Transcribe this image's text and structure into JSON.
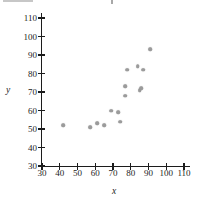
{
  "chart_data": {
    "type": "scatter",
    "title": "",
    "xlabel": "x",
    "ylabel": "y",
    "xlim": [
      30,
      110
    ],
    "ylim": [
      30,
      110
    ],
    "x_ticks": [
      30,
      40,
      50,
      60,
      70,
      80,
      90,
      100,
      110
    ],
    "y_ticks": [
      30,
      40,
      50,
      60,
      70,
      80,
      90,
      100,
      110
    ],
    "grid": false,
    "legend": false,
    "point_color": "#9b9b9b",
    "axis_color": "#1c1c1c",
    "points": [
      {
        "x": 42,
        "y": 52
      },
      {
        "x": 57,
        "y": 51
      },
      {
        "x": 61,
        "y": 53
      },
      {
        "x": 65,
        "y": 52
      },
      {
        "x": 69,
        "y": 60
      },
      {
        "x": 73,
        "y": 59
      },
      {
        "x": 74,
        "y": 54
      },
      {
        "x": 77,
        "y": 68
      },
      {
        "x": 77,
        "y": 73
      },
      {
        "x": 78,
        "y": 82
      },
      {
        "x": 84,
        "y": 84
      },
      {
        "x": 85,
        "y": 71
      },
      {
        "x": 86,
        "y": 72
      },
      {
        "x": 87,
        "y": 82
      },
      {
        "x": 91,
        "y": 93
      }
    ]
  }
}
